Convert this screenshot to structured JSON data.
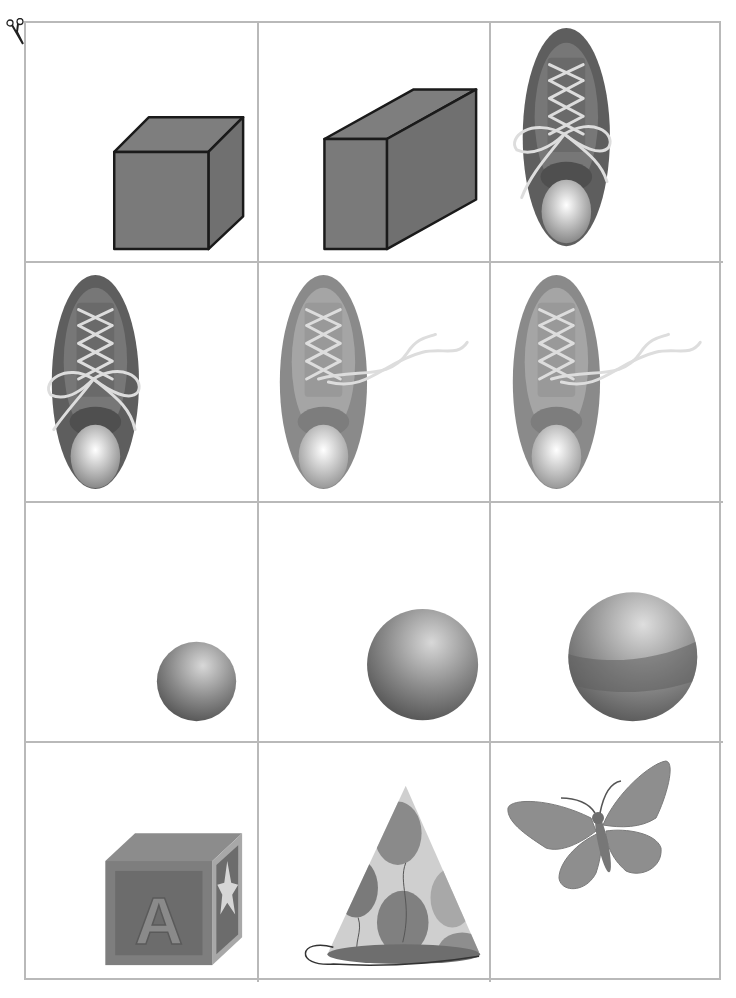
{
  "page": {
    "type": "picture-card worksheet",
    "cut_marker": "scissors-icon"
  },
  "grid": {
    "rows": 4,
    "columns": 3,
    "border_color": "#b9b9b9",
    "cards": [
      {
        "row": 1,
        "col": 1,
        "label": "small cube",
        "fill": "#7a7a7a"
      },
      {
        "row": 1,
        "col": 2,
        "label": "rectangular prism",
        "fill": "#7a7a7a"
      },
      {
        "row": 1,
        "col": 3,
        "label": "tied shoe (dark)",
        "fill": "#6e6e6e"
      },
      {
        "row": 2,
        "col": 1,
        "label": "tied shoe (dark)",
        "fill": "#6e6e6e"
      },
      {
        "row": 2,
        "col": 2,
        "label": "untied shoe (light)",
        "fill": "#9a9a9a"
      },
      {
        "row": 2,
        "col": 3,
        "label": "untied shoe (light)",
        "fill": "#9a9a9a"
      },
      {
        "row": 3,
        "col": 1,
        "label": "small ball",
        "fill": "#8a8a8a"
      },
      {
        "row": 3,
        "col": 2,
        "label": "medium ball",
        "fill": "#8a8a8a"
      },
      {
        "row": 3,
        "col": 3,
        "label": "large striped ball",
        "fill": "#8a8a8a"
      },
      {
        "row": 4,
        "col": 1,
        "label": "letter block A",
        "fill": "#858585"
      },
      {
        "row": 4,
        "col": 2,
        "label": "party hat",
        "fill": "#9a9a9a"
      },
      {
        "row": 4,
        "col": 3,
        "label": "butterfly",
        "fill": "#8e8e8e"
      }
    ]
  },
  "block_letter": "A"
}
